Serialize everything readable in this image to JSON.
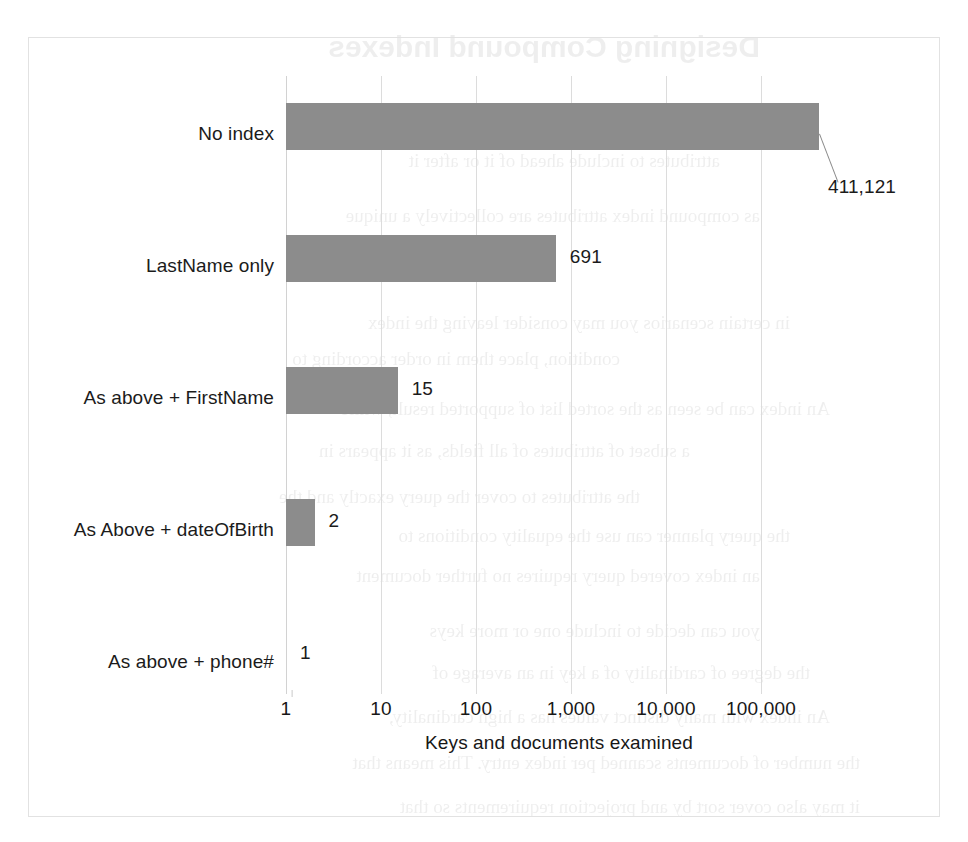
{
  "chart_data": {
    "type": "bar",
    "orientation": "horizontal",
    "title": "",
    "xlabel": "Keys and documents examined",
    "ylabel": "",
    "xscale": "log",
    "xlim": [
      1,
      1000000
    ],
    "xticks": [
      "1",
      "10",
      "100",
      "1,000",
      "10,000",
      "100,000"
    ],
    "xtick_values": [
      1,
      10,
      100,
      1000,
      10000,
      100000
    ],
    "grid": true,
    "legend": "none",
    "bar_color": "#8c8c8c",
    "categories": [
      "No index",
      "LastName only",
      "As above + FirstName",
      "As Above + dateOfBirth",
      "As above + phone#"
    ],
    "values": [
      411121,
      691,
      15,
      2,
      1
    ],
    "value_labels": [
      "411,121",
      "691",
      "15",
      "2",
      "1"
    ]
  },
  "bleed_text": {
    "lines": [
      "Designing Compound Indexes",
      "attributes to include ahead of it or after it",
      "as compound index attributes are collectively a unique",
      "all the data in a query",
      "in certain scenarios you may consider leaving the index",
      "condition, place them in order according to",
      "An index can be seen as the sorted list of supported result, while",
      "a subset of attributes of all fields, as it appears in",
      "the attributes to cover the query exactly and the",
      "the query planner can use the equality conditions to",
      "an index covered query requires no further document",
      "you can decide to include one or more keys",
      "the degree of cardinality of a key in an average of",
      "An index with many distinct values has a high cardinality,",
      "the number of documents scanned per index entry. This means that",
      "it may also cover sort by and projection requirements so that"
    ]
  }
}
